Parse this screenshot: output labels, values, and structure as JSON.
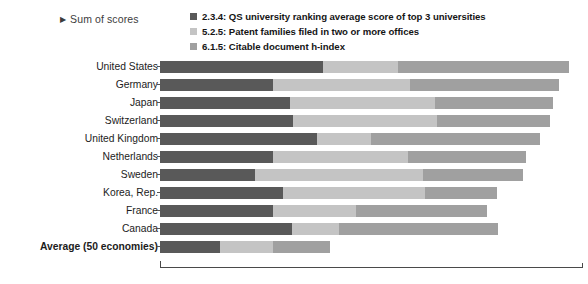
{
  "header": {
    "series_toggle_label": "Sum of scores",
    "toggle_icon": "triangle-right-icon"
  },
  "legend": {
    "position": "top",
    "items": [
      {
        "label": "2.3.4: QS university ranking average score of top 3 universities",
        "color": "#595959",
        "key": "2.3.4"
      },
      {
        "label": "5.2.5: Patent families filed in two or more offices",
        "color": "#c4c4c4",
        "key": "5.2.5"
      },
      {
        "label": "6.1.5: Citable document h-index",
        "color": "#a0a0a0",
        "key": "6.1.5"
      }
    ]
  },
  "chart_data": {
    "type": "bar",
    "orientation": "horizontal",
    "stacked": true,
    "title": "",
    "subtitle": "",
    "xlabel": "",
    "ylabel": "",
    "grid": false,
    "legend_position": "top",
    "axis_units": "Sum of scores",
    "xlim": [
      0,
      100
    ],
    "categories": [
      "United States",
      "Germany",
      "Japan",
      "Switzerland",
      "United Kingdom",
      "Netherlands",
      "Sweden",
      "Korea, Rep.",
      "France",
      "Canada",
      "Average (50 economies)"
    ],
    "total_row_index": 10,
    "series": [
      {
        "name": "2.3.4: QS university ranking average score of top 3 universities",
        "color": "#595959",
        "values": [
          38.5,
          26.7,
          30.7,
          31.4,
          37.1,
          26.7,
          22.5,
          29.1,
          26.7,
          31.2,
          14.2
        ]
      },
      {
        "name": "5.2.5: Patent families filed in two or more offices",
        "color": "#c4c4c4",
        "values": [
          17.7,
          32.4,
          34.3,
          34.0,
          12.8,
          31.9,
          39.7,
          33.6,
          19.6,
          11.1,
          12.5
        ]
      },
      {
        "name": "6.1.5: Citable document h-index",
        "color": "#a0a0a0",
        "values": [
          40.4,
          35.2,
          27.9,
          26.9,
          39.9,
          27.9,
          23.6,
          17.0,
          30.9,
          37.5,
          13.5
        ]
      }
    ],
    "totals": [
      96.6,
      94.3,
      92.9,
      92.2,
      89.8,
      86.5,
      85.8,
      79.7,
      77.2,
      79.8,
      40.2
    ]
  },
  "colors": {
    "background": "#ffffff",
    "axis": "#4a4a4a",
    "text": "#1c1c1c"
  }
}
